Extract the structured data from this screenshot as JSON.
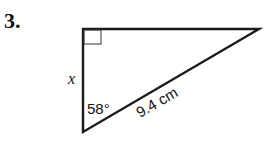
{
  "problem": {
    "number": "3.",
    "side_label": "x",
    "angle_label": "58°",
    "hypotenuse_label": "9.4 cm"
  }
}
